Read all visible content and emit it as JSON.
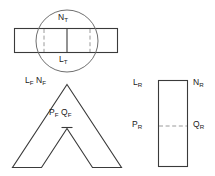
{
  "diagram": {
    "stroke_color": "#3a3a3a",
    "circle_color": "#6f6f6f",
    "dash_color": "#9a9a9a",
    "background_color": "#ffffff"
  },
  "figures": {
    "top": {
      "name": "top-view-figure",
      "shape": "horizontal-rectangle-with-circle",
      "labels": {
        "top": {
          "base": "N",
          "sub": "T",
          "text": "N_T"
        },
        "bottom": {
          "base": "L",
          "sub": "T",
          "text": "L_T"
        }
      }
    },
    "front": {
      "name": "front-view-figure",
      "shape": "chevron",
      "labels": {
        "upper_left_a": {
          "base": "L",
          "sub": "F",
          "text": "L_F"
        },
        "upper_left_b": {
          "base": "N",
          "sub": "F",
          "text": "N_F"
        },
        "center_a": {
          "base": "P",
          "sub": "F",
          "text": "P_F"
        },
        "center_b": {
          "base": "Q",
          "sub": "F",
          "text": "Q_F"
        }
      }
    },
    "right": {
      "name": "right-view-figure",
      "shape": "vertical-rectangle",
      "labels": {
        "top_left": {
          "base": "L",
          "sub": "R",
          "text": "L_R"
        },
        "top_right": {
          "base": "N",
          "sub": "R",
          "text": "N_R"
        },
        "mid_left": {
          "base": "P",
          "sub": "R",
          "text": "P_R"
        },
        "mid_right": {
          "base": "Q",
          "sub": "R",
          "text": "Q_R"
        }
      }
    }
  }
}
